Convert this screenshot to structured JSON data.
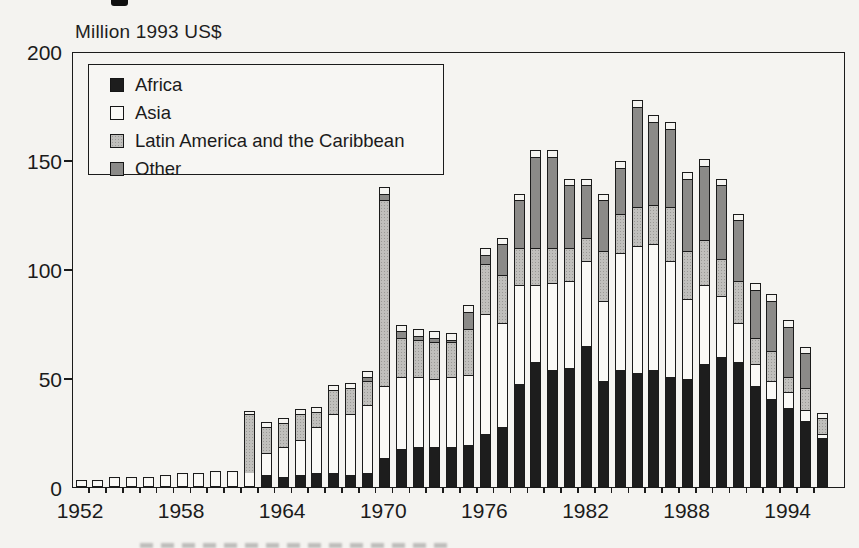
{
  "title": "Million 1993 US$",
  "colors": {
    "ink": "#1b1b1b",
    "africa": "#1d1d1d",
    "asia": "#faf9f6",
    "latin_america": "#c0bfbc",
    "other": "#8b8a88",
    "page_background": "#f4f3f0"
  },
  "legend": {
    "position": "top-left-inside-plot",
    "items": [
      {
        "label": "Africa",
        "swatch": "solid-black"
      },
      {
        "label": "Asia",
        "swatch": "white"
      },
      {
        "label": "Latin America and the Caribbean",
        "swatch": "light-halftone-gray"
      },
      {
        "label": "Other",
        "swatch": "dark-halftone-gray"
      }
    ]
  },
  "y_axis": {
    "tick_labels": [
      "0",
      "50",
      "100",
      "150",
      "200"
    ],
    "tick_values": [
      0,
      50,
      100,
      150,
      200
    ],
    "side_tick_values": [
      50,
      100,
      150
    ]
  },
  "x_axis": {
    "labeled_years": [
      1952,
      1958,
      1964,
      1970,
      1976,
      1982,
      1988,
      1994
    ],
    "minor_ticks": "every-year"
  },
  "chart_data": {
    "type": "bar",
    "stacked": true,
    "title": "Million 1993 US$",
    "ylabel": "Million 1993 US$",
    "ylim": [
      0,
      200
    ],
    "grid": false,
    "legend_position": "upper left",
    "categories": [
      1952,
      1953,
      1954,
      1955,
      1956,
      1957,
      1958,
      1959,
      1960,
      1961,
      1962,
      1963,
      1964,
      1965,
      1966,
      1967,
      1968,
      1969,
      1970,
      1971,
      1972,
      1973,
      1974,
      1975,
      1976,
      1977,
      1978,
      1979,
      1980,
      1981,
      1982,
      1983,
      1984,
      1985,
      1986,
      1987,
      1988,
      1989,
      1990,
      1991,
      1992,
      1993,
      1994,
      1995,
      1996
    ],
    "series": [
      {
        "name": "Africa",
        "values": [
          0,
          0,
          0,
          0,
          0,
          0,
          0,
          0,
          0,
          0,
          0,
          5,
          4,
          5,
          6,
          6,
          5,
          6,
          13,
          17,
          18,
          18,
          18,
          19,
          24,
          27,
          47,
          57,
          53,
          54,
          64,
          48,
          53,
          52,
          53,
          50,
          49,
          56,
          59,
          57,
          46,
          40,
          36,
          30,
          22
        ]
      },
      {
        "name": "Asia",
        "values": [
          2,
          2,
          3,
          3,
          3,
          4,
          5,
          5,
          6,
          6,
          6,
          10,
          14,
          16,
          21,
          27,
          28,
          31,
          33,
          33,
          32,
          31,
          32,
          32,
          55,
          48,
          45,
          35,
          40,
          40,
          39,
          37,
          54,
          58,
          58,
          53,
          37,
          36,
          28,
          18,
          10,
          8,
          7,
          5,
          2
        ]
      },
      {
        "name": "Latin America and the Caribbean",
        "values": [
          0,
          0,
          0,
          0,
          0,
          0,
          0,
          0,
          0,
          0,
          27,
          12,
          11,
          12,
          7,
          11,
          12,
          11,
          85,
          18,
          17,
          17,
          16,
          21,
          23,
          22,
          17,
          17,
          16,
          15,
          11,
          23,
          18,
          18,
          18,
          25,
          22,
          21,
          17,
          19,
          12,
          14,
          7,
          10,
          7
        ]
      },
      {
        "name": "Other",
        "values": [
          0,
          0,
          0,
          0,
          0,
          0,
          0,
          0,
          0,
          0,
          0,
          0,
          0,
          0,
          0,
          0,
          0,
          2,
          3,
          3,
          2,
          2,
          1,
          8,
          4,
          14,
          22,
          42,
          42,
          29,
          24,
          23,
          21,
          46,
          38,
          36,
          33,
          34,
          34,
          28,
          22,
          23,
          23,
          16,
          0
        ]
      }
    ]
  }
}
